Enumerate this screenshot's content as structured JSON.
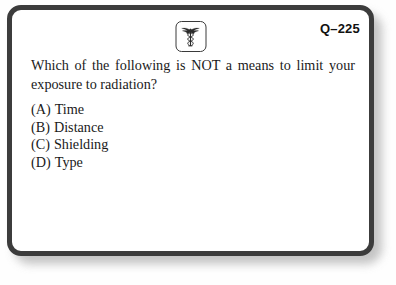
{
  "card": {
    "question_id": "Q–225",
    "icon": {
      "name": "caduceus-icon",
      "description": "caduceus medical symbol in rounded square frame"
    },
    "question": {
      "line1": "Which of the following is NOT a means to limit your",
      "line2": "exposure to radiation?",
      "full": "Which of the following is NOT a means to limit your exposure to radiation?"
    },
    "options": [
      {
        "key": "(A)",
        "label": "Time"
      },
      {
        "key": "(B)",
        "label": "Distance"
      },
      {
        "key": "(C)",
        "label": "Shielding"
      },
      {
        "key": "(D)",
        "label": "Type"
      }
    ]
  },
  "colors": {
    "card_border": "#3c3c3c",
    "card_background": "#ffffff",
    "page_background": "#fefefe",
    "text": "#1a1a1a",
    "shadow": "#b9b9b9"
  }
}
